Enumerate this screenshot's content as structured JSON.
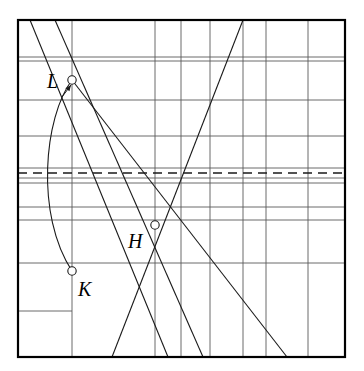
{
  "figure": {
    "title": "",
    "background_color": "#ffffff",
    "line_color": "#1a1a1a",
    "grid_color": "#5a5a5a",
    "border_color": "#000000",
    "marker_fill": "#ffffff"
  },
  "frame": {
    "x": 18,
    "y": 20,
    "width": 327,
    "height": 337,
    "stroke_width": 2.2
  },
  "grid": {
    "vertical_label": "vertical-gridlines",
    "horizontal_label": "horizontal-gridlines",
    "vertical_x": [
      72,
      155,
      181,
      210,
      243,
      266,
      308
    ],
    "horizontal_y": [
      57,
      61,
      100,
      136,
      168,
      178,
      183,
      207,
      220,
      263
    ],
    "stroke_width": 0.9
  },
  "dashed_line": {
    "name": "dashed-reference-line",
    "y": 173,
    "x1": 18,
    "x2": 345,
    "dash": "9 6",
    "stroke_width": 1.6
  },
  "short_segment": {
    "name": "short-tick-segment",
    "x1": 18,
    "y1": 311,
    "x2": 72,
    "y2": 311,
    "stroke_width": 0.9
  },
  "straight_lines": [
    {
      "name": "line-descending-steep-left",
      "x1": 30,
      "y1": 20,
      "x2": 168,
      "y2": 357
    },
    {
      "name": "line-descending-from-L",
      "x1": 55,
      "y1": 20,
      "x2": 203,
      "y2": 357
    },
    {
      "name": "line-descending-shallow",
      "x1": 72,
      "y1": 80,
      "x2": 287,
      "y2": 357
    },
    {
      "name": "line-ascending",
      "x1": 112,
      "y1": 357,
      "x2": 243,
      "y2": 20
    }
  ],
  "curve": {
    "name": "curve-K-to-L",
    "start": {
      "x": 72,
      "y": 271
    },
    "control_1": {
      "x": 35,
      "y": 215
    },
    "control_2": {
      "x": 44,
      "y": 117
    },
    "end": {
      "x": 72,
      "y": 80
    },
    "stroke_width": 1.1
  },
  "arrow": {
    "name": "arrow-to-L",
    "tip": {
      "x": 71,
      "y": 85
    },
    "tail": {
      "x": 62,
      "y": 97
    },
    "stroke_width": 1.0
  },
  "points": [
    {
      "name": "point-L",
      "label": "L",
      "x": 72,
      "y": 80,
      "radius": 4.2,
      "label_x": 47,
      "label_y": 88
    },
    {
      "name": "point-H",
      "label": "H",
      "x": 155,
      "y": 225,
      "radius": 4.2,
      "label_x": 128,
      "label_y": 248
    },
    {
      "name": "point-K",
      "label": "K",
      "x": 72,
      "y": 271,
      "radius": 4.2,
      "label_x": 78,
      "label_y": 296
    }
  ]
}
